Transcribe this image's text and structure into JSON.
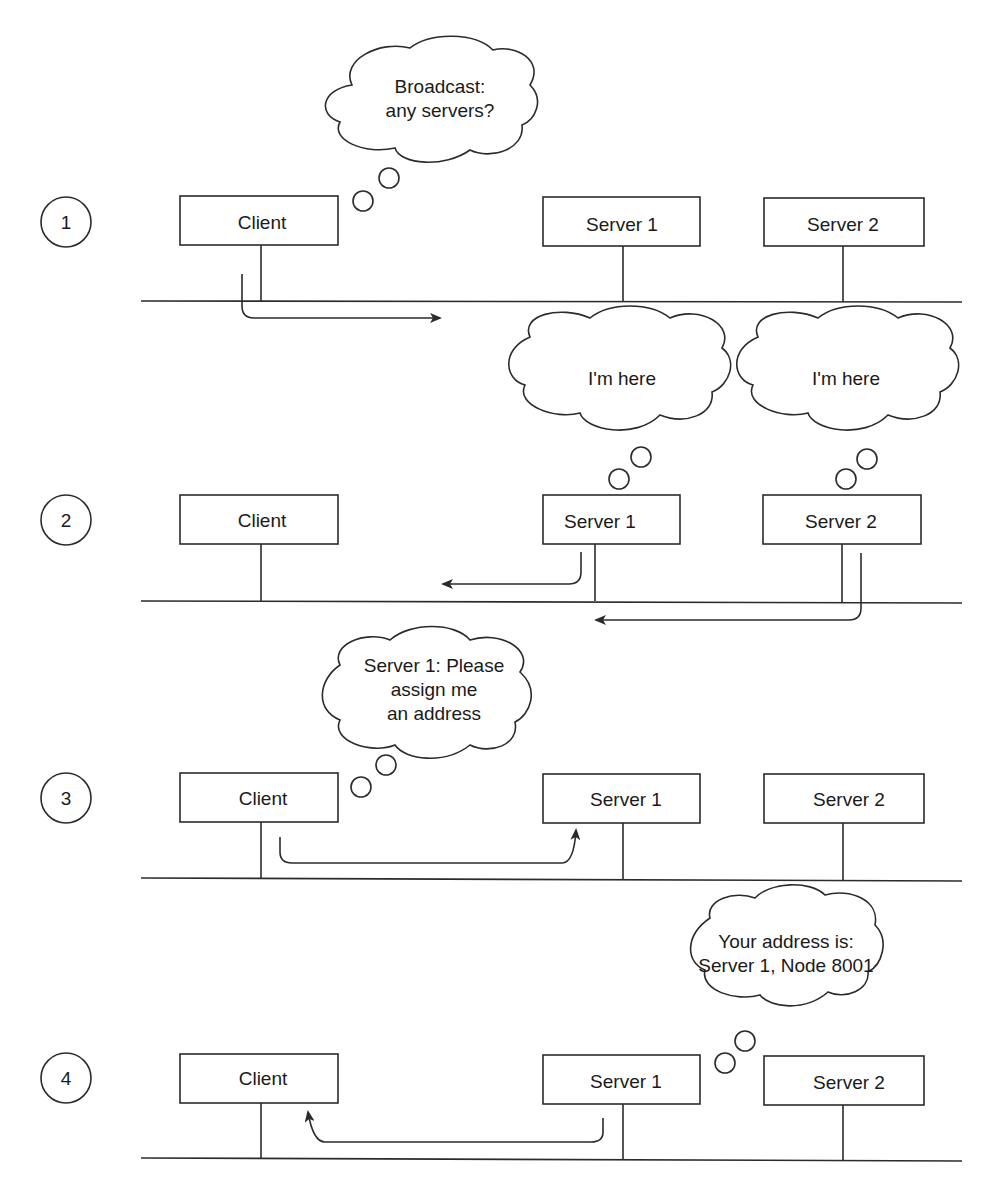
{
  "diagram": {
    "type": "network-address-assignment-sequence",
    "steps": [
      {
        "number": "1",
        "nodes": [
          "Client",
          "Server 1",
          "Server 2"
        ],
        "bubbles": [
          {
            "from": "Client",
            "lines": [
              "Broadcast:",
              "any servers?"
            ]
          }
        ],
        "arrows": [
          {
            "from": "Client",
            "direction": "right",
            "meaning": "broadcast"
          }
        ]
      },
      {
        "number": "2",
        "nodes": [
          "Client",
          "Server 1",
          "Server 2"
        ],
        "bubbles": [
          {
            "from": "Server 1",
            "lines": [
              "I'm here"
            ]
          },
          {
            "from": "Server 2",
            "lines": [
              "I'm here"
            ]
          }
        ],
        "arrows": [
          {
            "from": "Server 1",
            "direction": "left"
          },
          {
            "from": "Server 2",
            "direction": "left"
          }
        ]
      },
      {
        "number": "3",
        "nodes": [
          "Client",
          "Server 1",
          "Server 2"
        ],
        "bubbles": [
          {
            "from": "Client",
            "lines": [
              "Server 1: Please",
              "assign me",
              "an address"
            ]
          }
        ],
        "arrows": [
          {
            "from": "Client",
            "to": "Server 1"
          }
        ]
      },
      {
        "number": "4",
        "nodes": [
          "Client",
          "Server 1",
          "Server 2"
        ],
        "bubbles": [
          {
            "from": "Server 1",
            "lines": [
              "Your address is:",
              "Server 1, Node 8001"
            ]
          }
        ],
        "arrows": [
          {
            "from": "Server 1",
            "to": "Client"
          }
        ]
      }
    ]
  },
  "labels": {
    "step1": "1",
    "step2": "2",
    "step3": "3",
    "step4": "4",
    "client": "Client",
    "server1": "Server 1",
    "server2": "Server 2",
    "b1_l1": "Broadcast:",
    "b1_l2": "any servers?",
    "b2": "I'm here",
    "b3": "I'm here",
    "b4_l1": "Server 1: Please",
    "b4_l2": "assign me",
    "b4_l3": "an address",
    "b5_l1": "Your address is:",
    "b5_l2": "Server 1, Node 8001"
  },
  "colors": {
    "line": "#2b2b2b",
    "text": "#1a1a1a",
    "background": "#ffffff"
  }
}
